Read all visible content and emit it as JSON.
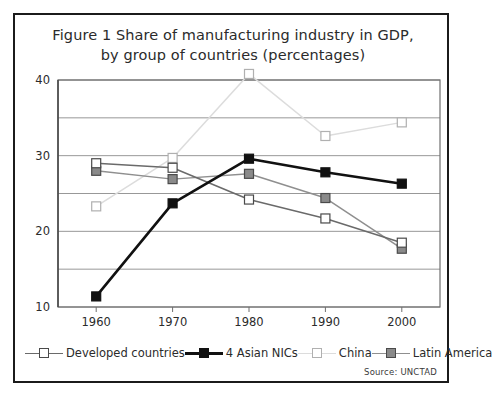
{
  "figure": {
    "title_line1": "Figure 1 Share of manufacturing industry in GDP,",
    "title_line2": "by group of countries (percentages)",
    "source": "Source: UNCTAD"
  },
  "chart_data": {
    "type": "line",
    "title": "Figure 1 Share of manufacturing industry in GDP, by group of countries (percentages)",
    "xlabel": "",
    "ylabel": "",
    "categories": [
      "1960",
      "1970",
      "1980",
      "1990",
      "2000"
    ],
    "x": [
      1960,
      1970,
      1980,
      1990,
      2000
    ],
    "ylim": [
      10,
      40
    ],
    "yticks": [
      10,
      20,
      30,
      40
    ],
    "ygridlines": [
      10,
      15,
      20,
      25,
      30,
      35,
      40
    ],
    "grid": true,
    "legend_position": "bottom",
    "series": [
      {
        "name": "Developed countries",
        "values": [
          29.0,
          28.4,
          24.2,
          21.7,
          18.5
        ],
        "marker": "square-open",
        "line_color": "#6a6a6a",
        "marker_fill": "#ffffff",
        "marker_edge": "#4a4a4a"
      },
      {
        "name": "4 Asian NICs",
        "values": [
          11.4,
          23.7,
          29.6,
          27.8,
          26.3
        ],
        "marker": "square-filled",
        "line_color": "#111111",
        "marker_fill": "#111111",
        "marker_edge": "#111111"
      },
      {
        "name": "China",
        "values": [
          23.3,
          29.7,
          40.8,
          32.6,
          34.4
        ],
        "marker": "square-open",
        "line_color": "#dcdcdc",
        "marker_fill": "#ffffff",
        "marker_edge": "#b0b0b0"
      },
      {
        "name": "Latin America",
        "values": [
          28.0,
          26.9,
          27.6,
          24.4,
          17.7
        ],
        "marker": "square-gray",
        "line_color": "#8f8f8f",
        "marker_fill": "#8a8a8a",
        "marker_edge": "#4a4a4a"
      }
    ]
  },
  "legend": {
    "items": [
      {
        "label": "Developed countries"
      },
      {
        "label": "4 Asian NICs"
      },
      {
        "label": "China"
      },
      {
        "label": "Latin America"
      }
    ]
  }
}
